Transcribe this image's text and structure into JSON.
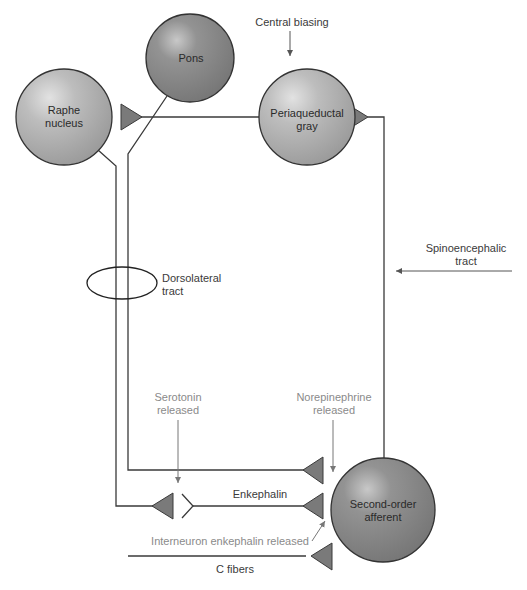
{
  "diagram": {
    "colors": {
      "line": "#3a3a3a",
      "synapse_fill": "#7a7a7a",
      "node_light": "#b8b8b8",
      "node_dark": "#8c8c8c",
      "label_dark": "#3a3a3a",
      "label_gray": "#8a8a8a"
    },
    "nodes": [
      {
        "id": "raphe",
        "label_line1": "Raphe",
        "label_line2": "nucleus",
        "cx": 64,
        "cy": 117,
        "r": 48
      },
      {
        "id": "pons",
        "label_line1": "Pons",
        "label_line2": "",
        "cx": 190,
        "cy": 58,
        "r": 44
      },
      {
        "id": "pag",
        "label_line1": "Periaqueductal",
        "label_line2": "gray",
        "cx": 307,
        "cy": 117,
        "r": 48
      },
      {
        "id": "second_order",
        "label_line1": "Second-order",
        "label_line2": "afferent",
        "cx": 383,
        "cy": 510,
        "r": 52
      }
    ],
    "labels": {
      "central_biasing": "Central biasing",
      "spinoencephalic_1": "Spinoencephalic",
      "spinoencephalic_2": "tract",
      "dorsolateral_1": "Dorsolateral",
      "dorsolateral_2": "tract",
      "serotonin_1": "Serotonin",
      "serotonin_2": "released",
      "norepinephrine_1": "Norepinephrine",
      "norepinephrine_2": "released",
      "enkephalin": "Enkephalin",
      "interneuron": "Interneuron enkephalin released",
      "c_fibers": "C fibers"
    }
  }
}
